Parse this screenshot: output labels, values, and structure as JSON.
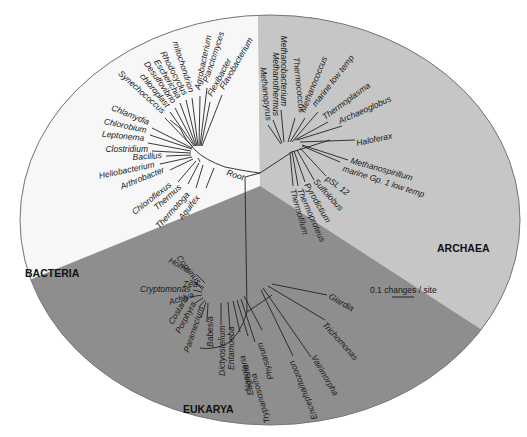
{
  "domains": [
    {
      "name": "BACTERIA",
      "color": "#f7f7f7"
    },
    {
      "name": "ARCHAEA",
      "color": "#c6c6c6"
    },
    {
      "name": "EUKARYA",
      "color": "#8e8e8e"
    }
  ],
  "root_label": "Root",
  "scale_bar": "0.1 changes / site",
  "bacteria": [
    "mitochondrion",
    "Agrobacterium",
    "Planctomyces",
    "Flexibacter",
    "Flavobacterium",
    "Rhodocyclus",
    "Escherichia",
    "Desulfovibrio",
    "chloroplast",
    "Synechococcus",
    "Chlamydia",
    "Chlorobium",
    "Leptonema",
    "Clostridium",
    "Bacillus",
    "Heliobacterium",
    "Arthrobacter",
    "Chloroflexus",
    "Thermus",
    "Thermotoga",
    "Aquifex"
  ],
  "archaea": [
    "Methanobacterium",
    "Methanothermus",
    "Methanopyrus",
    "Thermococcus",
    "Methanococcus",
    "marine low temp",
    "Thermoplasma",
    "Archaeoglobus",
    "Haloferax",
    "Methanospirillum",
    "marine Gp. 1 low temp",
    "pSL 12",
    "Sulfolobus",
    "Pyrodictium",
    "Thermoproteus",
    "Thermofilum"
  ],
  "eukarya": [
    "Coprinus",
    "Homo",
    "Zea",
    "Cryptomonas",
    "Achlya",
    "Costaria",
    "Porphyra",
    "Paramecium",
    "Babesia",
    "Dictyostelium",
    "Entamoeba",
    "Naegleria",
    "Euglena",
    "Trypanosoma",
    "Physarum",
    "Encephalitozoon",
    "Vairimorpha",
    "Trichomonas",
    "Giardia"
  ]
}
